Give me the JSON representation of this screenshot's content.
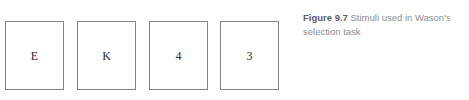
{
  "figure": {
    "background_color": "#ffffff",
    "card_border_color": "#858585",
    "card_fill_color": "#ffffff",
    "symbol_color": "#2e2e2e",
    "cards": [
      {
        "symbol": "E",
        "name": "card-e"
      },
      {
        "symbol": "K",
        "name": "card-k"
      },
      {
        "symbol": "4",
        "name": "card-4"
      },
      {
        "symbol": "3",
        "name": "card-3"
      }
    ],
    "caption": {
      "label": "Figure 9.7",
      "text": " Stimuli used in Wason's selection task",
      "label_color": "#5d5d5d",
      "text_color": "#8d8d8d"
    }
  }
}
